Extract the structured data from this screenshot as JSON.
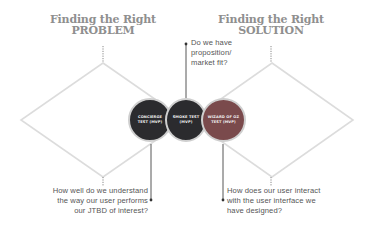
{
  "diagram": {
    "left": {
      "title_line1": "Finding the Right",
      "title_line2": "PROBLEM",
      "question_lines": [
        "How well do we understand",
        "the way our user performs",
        "our JTBD of interest?"
      ]
    },
    "right": {
      "title_line1": "Finding the Right",
      "title_line2": "SOLUTION",
      "question_lines": [
        "How does our user interact",
        "with the user interface we",
        "have designed?"
      ]
    },
    "center": {
      "question_lines": [
        "Do we have",
        "proposition/",
        "market fit?"
      ]
    },
    "circles": [
      {
        "label": "CONCIERGE TEST (MVP)",
        "color": "#2b2b2e"
      },
      {
        "label": "SMOKE TEST (MVP)",
        "color": "#2b2b2e"
      },
      {
        "label": "WIZARD OF OZ TEST (MVP)",
        "color": "#7a4a4c"
      }
    ],
    "colors": {
      "diamond_stroke": "#dcdcdc",
      "connector": "#444444",
      "title": "#8f8f8f"
    }
  }
}
